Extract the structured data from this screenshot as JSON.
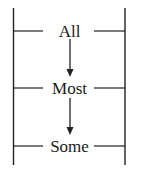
{
  "diagram": {
    "type": "hierarchy-ladder",
    "direction": "top-to-bottom",
    "levels": [
      {
        "label": "All",
        "y": 31
      },
      {
        "label": "Most",
        "y": 88
      },
      {
        "label": "Some",
        "y": 146
      }
    ],
    "arrows": [
      {
        "from": "All",
        "to": "Most"
      },
      {
        "from": "Most",
        "to": "Some"
      }
    ],
    "colors": {
      "line": "#222222",
      "text": "#1a1a1a",
      "background": "#ffffff"
    }
  }
}
